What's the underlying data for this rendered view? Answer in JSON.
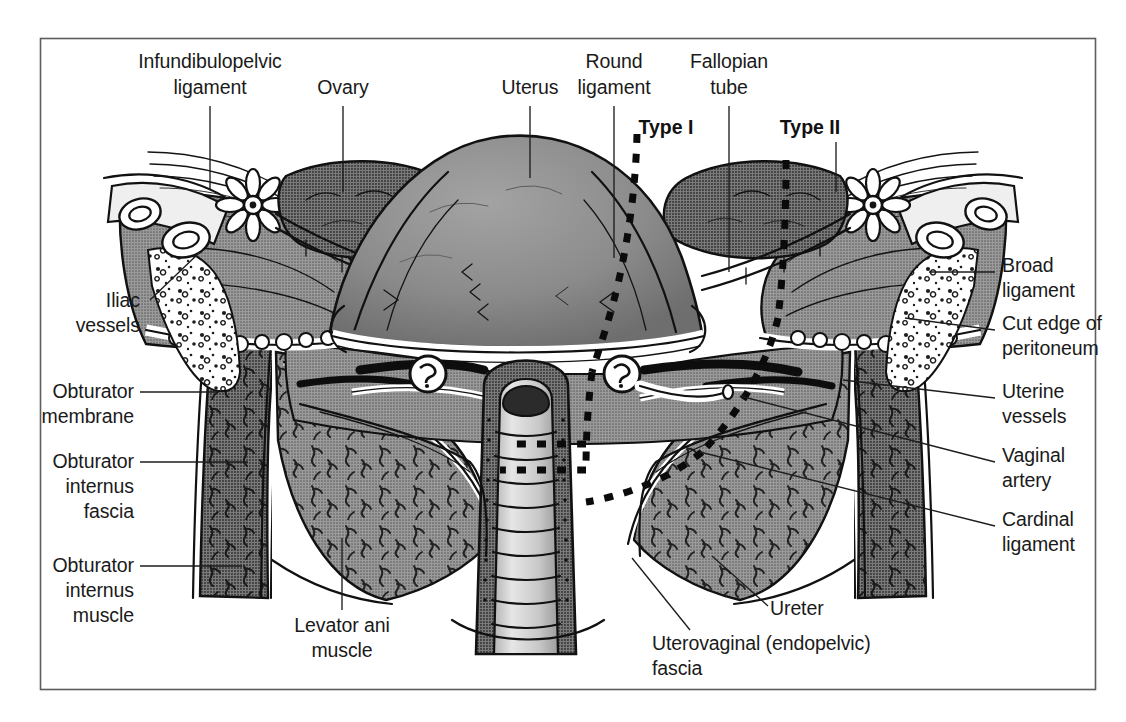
{
  "figure": {
    "frame_color": "#5d5d5d",
    "background_color": "#ffffff",
    "ink_color": "#111111"
  },
  "labels": {
    "infundibulopelvic_ligament": {
      "line1": "Infundibulopelvic",
      "line2": "ligament"
    },
    "ovary": {
      "line1": "Ovary"
    },
    "uterus": {
      "line1": "Uterus"
    },
    "round_ligament": {
      "line1": "Round",
      "line2": "ligament"
    },
    "fallopian_tube": {
      "line1": "Fallopian",
      "line2": "tube"
    },
    "type_i": {
      "line1": "Type I"
    },
    "type_ii": {
      "line1": "Type II"
    },
    "broad_ligament": {
      "line1": "Broad",
      "line2": "ligament"
    },
    "cut_edge_of_peritoneum": {
      "line1": "Cut edge of",
      "line2": "peritoneum"
    },
    "uterine_vessels": {
      "line1": "Uterine",
      "line2": "vessels"
    },
    "vaginal_artery": {
      "line1": "Vaginal",
      "line2": "artery"
    },
    "cardinal_ligament": {
      "line1": "Cardinal",
      "line2": "ligament"
    },
    "iliac_vessels": {
      "line1": "Iliac",
      "line2": "vessels"
    },
    "obturator_membrane": {
      "line1": "Obturator",
      "line2": "membrane"
    },
    "obturator_internus_fascia": {
      "line1": "Obturator",
      "line2": "internus",
      "line3": "fascia"
    },
    "obturator_internus_muscle": {
      "line1": "Obturator",
      "line2": "internus",
      "line3": "muscle"
    },
    "levator_ani_muscle": {
      "line1": "Levator ani",
      "line2": "muscle"
    },
    "ureter": {
      "line1": "Ureter"
    },
    "uterovaginal_fascia": {
      "line1": "Uterovaginal (endopelvic)",
      "line2": "fascia"
    }
  },
  "tones": {
    "tissue_mid": "#8d8d8d",
    "tissue_dark": "#6f6f6f",
    "tissue_light": "#b9b9b9",
    "tissue_pale": "#d6d6d6",
    "lumen_dark": "#2e2e2e",
    "white": "#ffffff"
  }
}
